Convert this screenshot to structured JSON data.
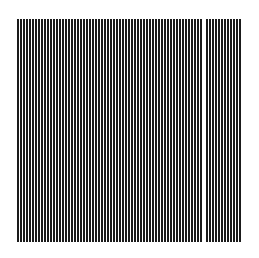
{
  "pattern": {
    "type": "vertical-stripes",
    "left": 17,
    "top": 19,
    "width": 224,
    "height": 223,
    "stripe_count": 75,
    "pitch": 3,
    "stripe_width": 1.7,
    "stripe_color": "#1a1a1a",
    "background_color": "#ffffff",
    "missing_stripe_indices": [
      62
    ]
  }
}
